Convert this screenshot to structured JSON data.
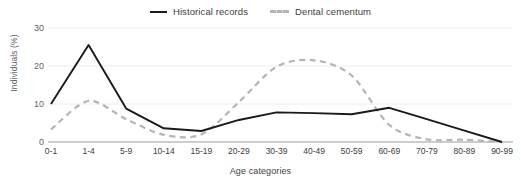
{
  "legend": {
    "position": "top-center",
    "items": [
      {
        "label": "Historical records",
        "style": "solid",
        "color": "#1a1a1a",
        "icon": "line-solid-icon"
      },
      {
        "label": "Dental cementum",
        "style": "dashed",
        "color": "#b5b5b5",
        "icon": "line-dashed-icon"
      }
    ]
  },
  "axes": {
    "y_title": "Individuals (%)",
    "x_title": "Age categories",
    "y_ticks": [
      "0",
      "10",
      "20",
      "30"
    ]
  },
  "chart_data": {
    "type": "line",
    "title": "",
    "subtitle": "",
    "xlabel": "Age categories",
    "ylabel": "Individuals (%)",
    "categories": [
      "0-1",
      "1-4",
      "5-9",
      "10-14",
      "15-19",
      "20-29",
      "30-39",
      "40-49",
      "50-59",
      "60-69",
      "70-79",
      "80-89",
      "90-99"
    ],
    "series": [
      {
        "name": "Historical records",
        "color": "#1a1a1a",
        "style": "solid",
        "values": [
          10.0,
          25.5,
          8.8,
          3.6,
          2.9,
          5.8,
          7.8,
          7.6,
          7.3,
          9.0,
          6.0,
          3.0,
          0.0
        ]
      },
      {
        "name": "Dental cementum",
        "color": "#b5b5b5",
        "style": "dashed",
        "values": [
          3.3,
          10.8,
          6.0,
          1.9,
          2.0,
          10.5,
          19.8,
          21.5,
          17.5,
          4.5,
          0.7,
          0.6,
          0.0
        ]
      }
    ],
    "ylim": [
      0,
      32
    ],
    "yticks": [
      0,
      10,
      20,
      30
    ],
    "grid": true,
    "grid_axis": "y",
    "legend_position": "top-center"
  },
  "colors": {
    "grid": "#ececec",
    "axis": "#bdbdbd",
    "text": "#3c4043",
    "muted_text": "#5f6368",
    "background": "#ffffff"
  }
}
